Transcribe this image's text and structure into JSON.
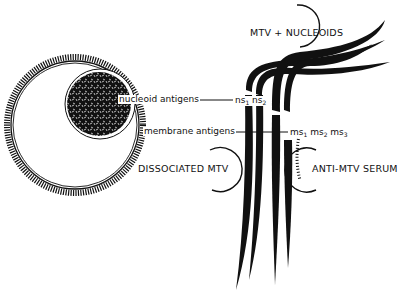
{
  "figure": {
    "type": "immunodiffusion schematic",
    "virus_particle": {
      "label_nucleoid": "nucleoid antigens",
      "label_membrane": "membrane antigens"
    },
    "wells": {
      "top": "MTV + NUCLEOIDS",
      "left": "DISSOCIATED MTV",
      "right": "ANTI-MTV SERUM"
    },
    "precipitin_lines": {
      "nucleoid": [
        "ns",
        "ns"
      ],
      "nucleoid_subs": [
        "1",
        "2"
      ],
      "membrane": [
        "ms",
        "ms",
        "ms"
      ],
      "membrane_subs": [
        "1",
        "2",
        "3"
      ]
    },
    "colors": {
      "ink": "#111111",
      "background": "#ffffff"
    }
  }
}
